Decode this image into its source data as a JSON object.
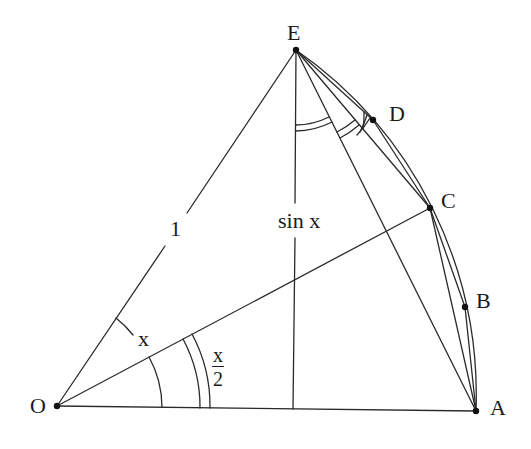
{
  "figure": {
    "points": {
      "O": {
        "label": "O",
        "x": 57,
        "y": 406
      },
      "A": {
        "label": "A",
        "x": 476,
        "y": 411
      },
      "B": {
        "label": "B",
        "x": 465,
        "y": 307
      },
      "C": {
        "label": "C",
        "x": 430,
        "y": 208
      },
      "D": {
        "label": "D",
        "x": 373,
        "y": 120
      },
      "E": {
        "label": "E",
        "x": 296,
        "y": 50
      }
    },
    "labels": {
      "radius": "1",
      "height": "sin x",
      "angle_full": "x",
      "angle_half_num": "x",
      "angle_half_den": "2"
    },
    "segments": [
      [
        "O",
        "A"
      ],
      [
        "O",
        "E"
      ],
      [
        "O",
        "C"
      ],
      [
        "E",
        "A"
      ],
      [
        "E",
        "C"
      ],
      [
        "E",
        "D"
      ],
      [
        "C",
        "A"
      ],
      [
        "C",
        "B"
      ],
      [
        "B",
        "A"
      ]
    ],
    "arc": [
      "A",
      "B",
      "C",
      "D",
      "E"
    ],
    "foot_of_perpendicular": {
      "x": 293,
      "y": 409
    },
    "stroke_color": "#2a2a2a",
    "background": "#ffffff"
  }
}
